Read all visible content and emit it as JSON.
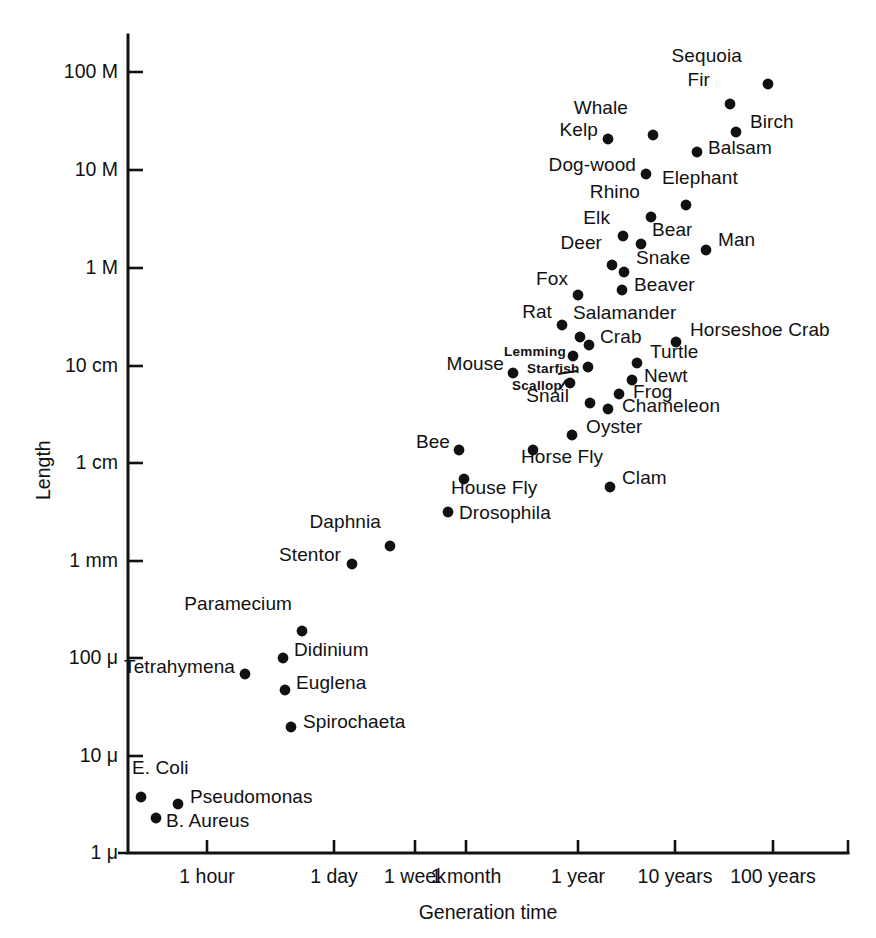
{
  "chart_data": {
    "type": "scatter",
    "title": "",
    "xlabel": "Generation time",
    "ylabel": "Length",
    "xscale": "log",
    "yscale": "log",
    "grid": false,
    "legend": null,
    "xticklabels": [
      "1 hour",
      "1 day",
      "1 week",
      "1 month",
      "1 year",
      "10 years",
      "100 years"
    ],
    "yticklabels": [
      "100 M",
      "10 M",
      "1 M",
      "10 cm",
      "1 cm",
      "1 mm",
      "100 μ",
      "10 μ",
      "1 μ"
    ],
    "points": [
      {
        "name": "Sequoia",
        "px": 768,
        "py": 84,
        "lx": 742,
        "ly": 56,
        "anchor": "end",
        "size": "normal"
      },
      {
        "name": "Fir",
        "px": 730,
        "py": 104,
        "lx": 710,
        "ly": 80,
        "anchor": "end",
        "size": "normal"
      },
      {
        "name": "Whale",
        "px": 653,
        "py": 135,
        "lx": 628,
        "ly": 108,
        "anchor": "end",
        "size": "normal"
      },
      {
        "name": "Birch",
        "px": 736,
        "py": 132,
        "lx": 750,
        "ly": 122,
        "anchor": "start",
        "size": "normal"
      },
      {
        "name": "Kelp",
        "px": 608,
        "py": 139,
        "lx": 598,
        "ly": 130,
        "anchor": "end",
        "size": "normal"
      },
      {
        "name": "Balsam",
        "px": 697,
        "py": 152,
        "lx": 708,
        "ly": 148,
        "anchor": "start",
        "size": "normal"
      },
      {
        "name": "Dog-wood",
        "px": 646,
        "py": 174,
        "lx": 636,
        "ly": 165,
        "anchor": "end",
        "size": "normal"
      },
      {
        "name": "Elephant",
        "px": 686,
        "py": 205,
        "lx": 662,
        "ly": 178,
        "anchor": "start",
        "size": "normal"
      },
      {
        "name": "Rhino",
        "px": 651,
        "py": 217,
        "lx": 640,
        "ly": 192,
        "anchor": "end",
        "size": "normal"
      },
      {
        "name": "Elk",
        "px": 623,
        "py": 236,
        "lx": 610,
        "ly": 218,
        "anchor": "end",
        "size": "normal"
      },
      {
        "name": "Bear",
        "px": 641,
        "py": 244,
        "lx": 652,
        "ly": 230,
        "anchor": "start",
        "size": "normal"
      },
      {
        "name": "Man",
        "px": 706,
        "py": 250,
        "lx": 718,
        "ly": 240,
        "anchor": "start",
        "size": "normal"
      },
      {
        "name": "Deer",
        "px": 612,
        "py": 265,
        "lx": 602,
        "ly": 243,
        "anchor": "end",
        "size": "normal"
      },
      {
        "name": "Snake",
        "px": 624,
        "py": 272,
        "lx": 636,
        "ly": 258,
        "anchor": "start",
        "size": "normal"
      },
      {
        "name": "Fox",
        "px": 578,
        "py": 295,
        "lx": 568,
        "ly": 279,
        "anchor": "end",
        "size": "normal"
      },
      {
        "name": "Beaver",
        "px": 622,
        "py": 290,
        "lx": 634,
        "ly": 285,
        "anchor": "start",
        "size": "normal"
      },
      {
        "name": "Rat",
        "px": 562,
        "py": 325,
        "lx": 552,
        "ly": 312,
        "anchor": "end",
        "size": "normal"
      },
      {
        "name": "Salamander",
        "px": 580,
        "py": 337,
        "lx": 573,
        "ly": 313,
        "anchor": "start",
        "size": "normal"
      },
      {
        "name": "Crab",
        "px": 589,
        "py": 345,
        "lx": 600,
        "ly": 337,
        "anchor": "start",
        "size": "normal"
      },
      {
        "name": "Horseshoe Crab",
        "px": 676,
        "py": 342,
        "lx": 690,
        "ly": 330,
        "anchor": "start",
        "size": "normal"
      },
      {
        "name": "Lemming",
        "px": 573,
        "py": 356,
        "lx": 566,
        "ly": 349,
        "anchor": "end",
        "size": "small"
      },
      {
        "name": "Turtle",
        "px": 637,
        "py": 363,
        "lx": 650,
        "ly": 352,
        "anchor": "start",
        "size": "normal"
      },
      {
        "name": "Mouse",
        "px": 513,
        "py": 373,
        "lx": 504,
        "ly": 364,
        "anchor": "end",
        "size": "normal"
      },
      {
        "name": "Starfish",
        "px": 588,
        "py": 367,
        "lx": 527,
        "ly": 366,
        "anchor": "start",
        "size": "small",
        "leader": [
          577,
          371,
          558,
          374
        ]
      },
      {
        "name": "Newt",
        "px": 632,
        "py": 380,
        "lx": 644,
        "ly": 376,
        "anchor": "start",
        "size": "normal"
      },
      {
        "name": "Scallop",
        "px": 570,
        "py": 383,
        "lx": 512,
        "ly": 383,
        "anchor": "start",
        "size": "small",
        "leader": [
          566,
          380,
          560,
          389
        ]
      },
      {
        "name": "Frog",
        "px": 619,
        "py": 394,
        "lx": 633,
        "ly": 392,
        "anchor": "start",
        "size": "normal"
      },
      {
        "name": "Snail",
        "px": 590,
        "py": 403,
        "lx": 569,
        "ly": 396,
        "anchor": "end",
        "size": "normal"
      },
      {
        "name": "Chameleon",
        "px": 608,
        "py": 409,
        "lx": 622,
        "ly": 406,
        "anchor": "start",
        "size": "normal"
      },
      {
        "name": "Oyster",
        "px": 572,
        "py": 435,
        "lx": 586,
        "ly": 427,
        "anchor": "start",
        "size": "normal"
      },
      {
        "name": "Bee",
        "px": 459,
        "py": 450,
        "lx": 450,
        "ly": 442,
        "anchor": "end",
        "size": "normal"
      },
      {
        "name": "Horse Fly",
        "px": 533,
        "py": 450,
        "lx": 521,
        "ly": 457,
        "anchor": "start",
        "size": "normal"
      },
      {
        "name": "Clam",
        "px": 610,
        "py": 487,
        "lx": 622,
        "ly": 478,
        "anchor": "start",
        "size": "normal"
      },
      {
        "name": "House Fly",
        "px": 464,
        "py": 479,
        "lx": 451,
        "ly": 488,
        "anchor": "start",
        "size": "normal"
      },
      {
        "name": "Drosophila",
        "px": 448,
        "py": 512,
        "lx": 459,
        "ly": 513,
        "anchor": "start",
        "size": "normal"
      },
      {
        "name": "Daphnia",
        "px": 390,
        "py": 546,
        "lx": 381,
        "ly": 522,
        "anchor": "end",
        "size": "normal"
      },
      {
        "name": "Stentor",
        "px": 352,
        "py": 564,
        "lx": 341,
        "ly": 555,
        "anchor": "end",
        "size": "normal"
      },
      {
        "name": "Paramecium",
        "px": 302,
        "py": 631,
        "lx": 292,
        "ly": 604,
        "anchor": "end",
        "size": "normal"
      },
      {
        "name": "Didinium",
        "px": 283,
        "py": 658,
        "lx": 294,
        "ly": 650,
        "anchor": "start",
        "size": "normal"
      },
      {
        "name": "Tetrahymena",
        "px": 245,
        "py": 674,
        "lx": 235,
        "ly": 667,
        "anchor": "end",
        "size": "normal"
      },
      {
        "name": "Euglena",
        "px": 285,
        "py": 690,
        "lx": 296,
        "ly": 683,
        "anchor": "start",
        "size": "normal"
      },
      {
        "name": "Spirochaeta",
        "px": 291,
        "py": 727,
        "lx": 303,
        "ly": 722,
        "anchor": "start",
        "size": "normal"
      },
      {
        "name": "E. Coli",
        "px": 141,
        "py": 797,
        "lx": 132,
        "ly": 768,
        "anchor": "start",
        "size": "normal"
      },
      {
        "name": "Pseudomonas",
        "px": 178,
        "py": 804,
        "lx": 190,
        "ly": 797,
        "anchor": "start",
        "size": "normal"
      },
      {
        "name": "B. Aureus",
        "px": 156,
        "py": 818,
        "lx": 166,
        "ly": 821,
        "anchor": "start",
        "size": "normal"
      }
    ]
  },
  "axes": {
    "plot_left": 128,
    "plot_right": 848,
    "plot_top": 35,
    "plot_bottom": 853,
    "yticks": [
      {
        "label": "100 M",
        "y": 72
      },
      {
        "label": "10 M",
        "y": 170
      },
      {
        "label": "1 M",
        "y": 268
      },
      {
        "label": "10 cm",
        "y": 366
      },
      {
        "label": "1 cm",
        "y": 463
      },
      {
        "label": "1 mm",
        "y": 561
      },
      {
        "label": "100 μ",
        "y": 658
      },
      {
        "label": "10 μ",
        "y": 756
      },
      {
        "label": "1 μ",
        "y": 853
      }
    ],
    "xticks": [
      {
        "label": "1 hour",
        "x": 207
      },
      {
        "label": "1 day",
        "x": 334
      },
      {
        "label": "1 week",
        "x": 415
      },
      {
        "label": "1 month",
        "x": 466
      },
      {
        "label": "1 year",
        "x": 578
      },
      {
        "label": "10 years",
        "x": 675
      },
      {
        "label": "100 years",
        "x": 773
      }
    ],
    "axis_color": "#111111",
    "point_color": "#111111"
  }
}
